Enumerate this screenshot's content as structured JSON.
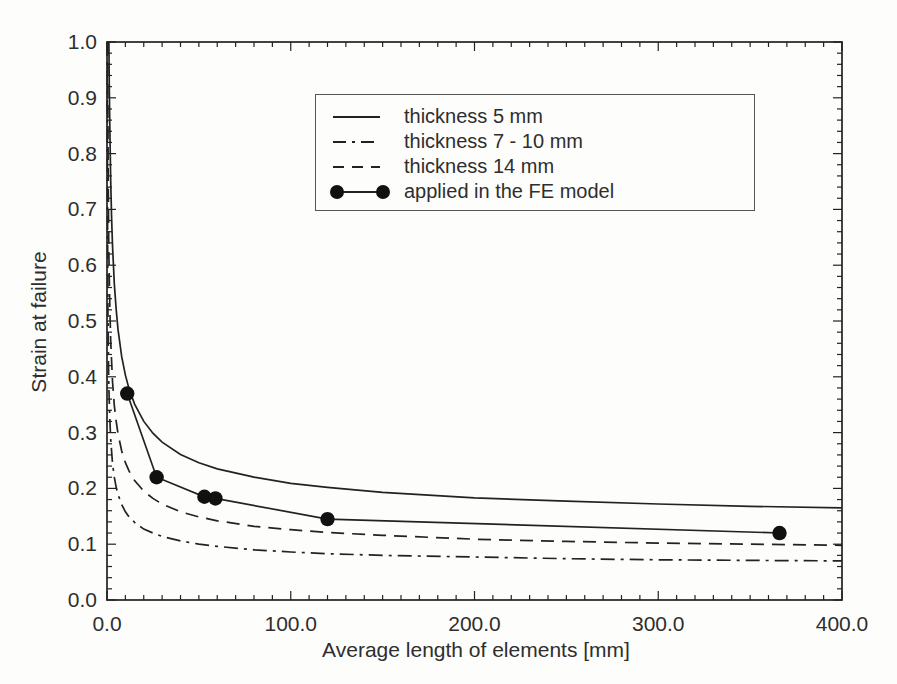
{
  "chart_data": {
    "type": "line",
    "title": "",
    "xlabel": "Average length of elements [mm]",
    "ylabel": "Strain at failure",
    "xlim": [
      0,
      400
    ],
    "ylim": [
      0,
      1.0
    ],
    "x_ticks": [
      0,
      100,
      200,
      300,
      400
    ],
    "x_tick_labels": [
      "0.0",
      "100.0",
      "200.0",
      "300.0",
      "400.0"
    ],
    "x_minor_step": 10,
    "y_ticks": [
      0,
      0.1,
      0.2,
      0.3,
      0.4,
      0.5,
      0.6,
      0.7,
      0.8,
      0.9,
      1.0
    ],
    "y_tick_labels": [
      "0.0",
      "0.1",
      "0.2",
      "0.3",
      "0.4",
      "0.5",
      "0.6",
      "0.7",
      "0.8",
      "0.9",
      "1.0"
    ],
    "y_minor_step": 0.02,
    "grid": false,
    "legend_position": "inside top-center, boxed",
    "line_color": "#222222",
    "marker_color": "#111111",
    "series": [
      {
        "name": "thickness 5 mm",
        "style": "solid",
        "marker": "none",
        "points": [
          [
            1.03,
            1.0
          ],
          [
            1.2,
            0.936
          ],
          [
            1.5,
            0.85
          ],
          [
            2,
            0.752
          ],
          [
            2.5,
            0.685
          ],
          [
            3,
            0.636
          ],
          [
            4,
            0.567
          ],
          [
            5,
            0.52
          ],
          [
            6,
            0.485
          ],
          [
            8,
            0.436
          ],
          [
            10,
            0.403
          ],
          [
            12,
            0.378
          ],
          [
            15,
            0.351
          ],
          [
            20,
            0.32
          ],
          [
            25,
            0.299
          ],
          [
            30,
            0.283
          ],
          [
            40,
            0.261
          ],
          [
            50,
            0.246
          ],
          [
            60,
            0.235
          ],
          [
            80,
            0.22
          ],
          [
            100,
            0.209
          ],
          [
            120,
            0.202
          ],
          [
            150,
            0.193
          ],
          [
            200,
            0.183
          ],
          [
            250,
            0.177
          ],
          [
            300,
            0.172
          ],
          [
            350,
            0.168
          ],
          [
            400,
            0.165
          ]
        ]
      },
      {
        "name": "thickness 7 - 10 mm",
        "style": "dash-dot",
        "marker": "none",
        "points": [
          [
            0.12,
            1.0
          ],
          [
            0.2,
            0.798
          ],
          [
            0.3,
            0.661
          ],
          [
            0.5,
            0.524
          ],
          [
            0.8,
            0.425
          ],
          [
            1,
            0.386
          ],
          [
            1.5,
            0.325
          ],
          [
            2,
            0.288
          ],
          [
            3,
            0.245
          ],
          [
            4,
            0.22
          ],
          [
            5,
            0.202
          ],
          [
            6,
            0.189
          ],
          [
            8,
            0.171
          ],
          [
            10,
            0.158
          ],
          [
            12,
            0.149
          ],
          [
            15,
            0.139
          ],
          [
            20,
            0.127
          ],
          [
            25,
            0.12
          ],
          [
            30,
            0.114
          ],
          [
            40,
            0.106
          ],
          [
            50,
            0.1
          ],
          [
            60,
            0.096
          ],
          [
            80,
            0.09
          ],
          [
            100,
            0.086
          ],
          [
            120,
            0.083
          ],
          [
            150,
            0.08
          ],
          [
            200,
            0.077
          ],
          [
            250,
            0.074
          ],
          [
            300,
            0.072
          ],
          [
            350,
            0.071
          ],
          [
            400,
            0.07
          ]
        ]
      },
      {
        "name": "thickness 14 mm",
        "style": "dashed",
        "marker": "none",
        "points": [
          [
            0.36,
            1.0
          ],
          [
            0.5,
            0.859
          ],
          [
            0.7,
            0.737
          ],
          [
            1,
            0.628
          ],
          [
            1.5,
            0.526
          ],
          [
            2,
            0.465
          ],
          [
            3,
            0.392
          ],
          [
            4,
            0.349
          ],
          [
            5,
            0.32
          ],
          [
            6,
            0.298
          ],
          [
            8,
            0.267
          ],
          [
            10,
            0.246
          ],
          [
            12,
            0.231
          ],
          [
            15,
            0.214
          ],
          [
            20,
            0.195
          ],
          [
            25,
            0.182
          ],
          [
            30,
            0.172
          ],
          [
            40,
            0.158
          ],
          [
            50,
            0.149
          ],
          [
            60,
            0.142
          ],
          [
            80,
            0.132
          ],
          [
            100,
            0.126
          ],
          [
            120,
            0.121
          ],
          [
            150,
            0.116
          ],
          [
            200,
            0.109
          ],
          [
            250,
            0.105
          ],
          [
            300,
            0.102
          ],
          [
            350,
            0.1
          ],
          [
            400,
            0.098
          ]
        ]
      },
      {
        "name": "applied in the FE model",
        "style": "solid",
        "marker": "filled-circle",
        "points": [
          [
            11,
            0.37
          ],
          [
            27,
            0.22
          ],
          [
            53,
            0.185
          ],
          [
            59,
            0.182
          ],
          [
            120,
            0.145
          ],
          [
            366,
            0.12
          ]
        ]
      }
    ]
  }
}
